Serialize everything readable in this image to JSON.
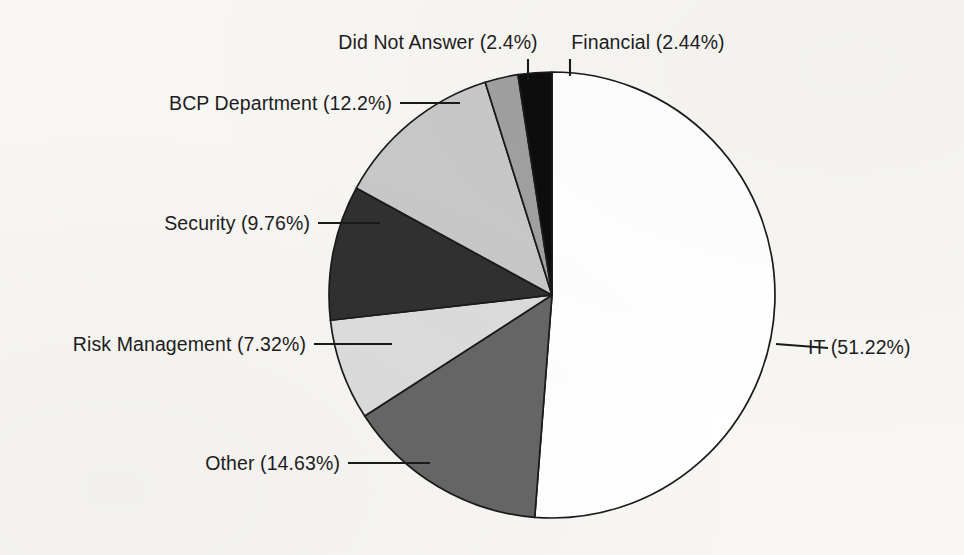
{
  "chart_data": {
    "type": "pie",
    "title": "",
    "subtitle": "",
    "xlabel": "",
    "ylabel": "",
    "legend_position": "none",
    "grid": false,
    "labels_show_percent": true,
    "start_angle_deg": 0,
    "direction": "clockwise",
    "categories": [
      "IT",
      "Other",
      "Risk Management",
      "Security",
      "BCP Department",
      "Did Not Answer",
      "Financial"
    ],
    "values": [
      51.22,
      14.63,
      7.32,
      9.76,
      12.2,
      2.4,
      2.44
    ],
    "value_unit": "%",
    "slices": [
      {
        "name": "IT",
        "percent": 51.22,
        "label": "IT (51.22%)",
        "color": "#ffffff",
        "label_anchor": "start",
        "label_x": 808,
        "label_y": 354,
        "leader": "M 776 344 L 828 348"
      },
      {
        "name": "Other",
        "percent": 14.63,
        "label": "Other (14.63%)",
        "color": "#666666",
        "label_anchor": "end",
        "label_x": 340,
        "label_y": 470,
        "leader": "M 348 463 L 430 463"
      },
      {
        "name": "Risk Management",
        "percent": 7.32,
        "label": "Risk Management (7.32%)",
        "color": "#dcdcdc",
        "label_anchor": "end",
        "label_x": 306,
        "label_y": 351,
        "leader": "M 314 344 L 392 344"
      },
      {
        "name": "Security",
        "percent": 9.76,
        "label": "Security (9.76%)",
        "color": "#303030",
        "label_anchor": "end",
        "label_x": 310,
        "label_y": 230,
        "leader": "M 318 223 L 380 223"
      },
      {
        "name": "BCP Department",
        "percent": 12.2,
        "label": "BCP Department (12.2%)",
        "color": "#c8c8c8",
        "label_anchor": "end",
        "label_x": 392,
        "label_y": 110,
        "leader": "M 400 103 L 460 103"
      },
      {
        "name": "Did Not Answer",
        "percent": 2.4,
        "label": "Did Not Answer (2.4%)",
        "color": "#a0a0a0",
        "label_anchor": "mid",
        "label_x": 438,
        "label_y": 49,
        "leader": "M 528 59 L 528 80"
      },
      {
        "name": "Financial",
        "percent": 2.44,
        "label": "Financial (2.44%)",
        "color": "#0d0d0d",
        "label_anchor": "mid",
        "label_x": 648,
        "label_y": 49,
        "leader": "M 570 59 L 570 76"
      }
    ],
    "geometry": {
      "center_x": 552,
      "center_y": 295,
      "radius": 223
    },
    "colors": {
      "outline": "#1a1a1a",
      "background": "#f7f6f3",
      "text": "#1d1d1d"
    }
  }
}
